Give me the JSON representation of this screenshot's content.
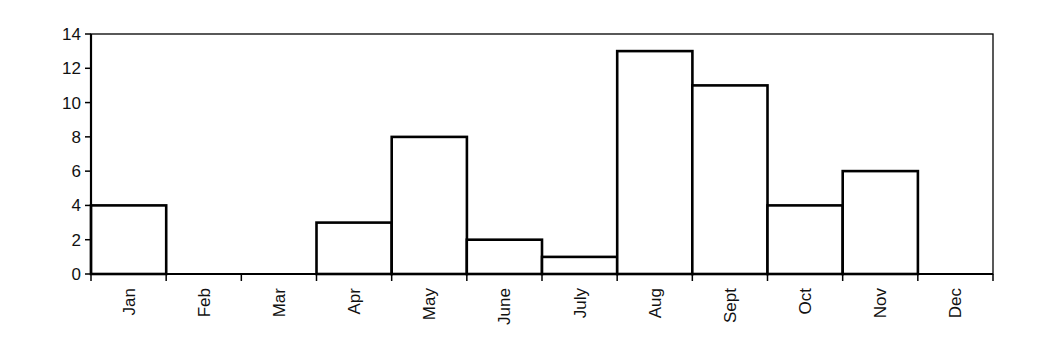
{
  "chart_data": {
    "type": "bar",
    "title": "",
    "xlabel": "",
    "ylabel": "",
    "categories": [
      "Jan",
      "Feb",
      "Mar",
      "Apr",
      "May",
      "June",
      "July",
      "Aug",
      "Sept",
      "Oct",
      "Nov",
      "Dec"
    ],
    "values": [
      4,
      0,
      0,
      3,
      8,
      2,
      1,
      13,
      11,
      4,
      6,
      0
    ],
    "ylim": [
      0,
      14
    ],
    "yticks": [
      0,
      2,
      4,
      6,
      8,
      10,
      12,
      14
    ],
    "grid": false,
    "legend": null,
    "bar_style": {
      "fill": "#ffffff",
      "stroke": "#000000",
      "gap": 0
    },
    "x_label_rotation": -90
  },
  "colors": {
    "background": "#ffffff",
    "axis": "#000000",
    "bar_fill": "#ffffff",
    "bar_stroke": "#000000"
  }
}
